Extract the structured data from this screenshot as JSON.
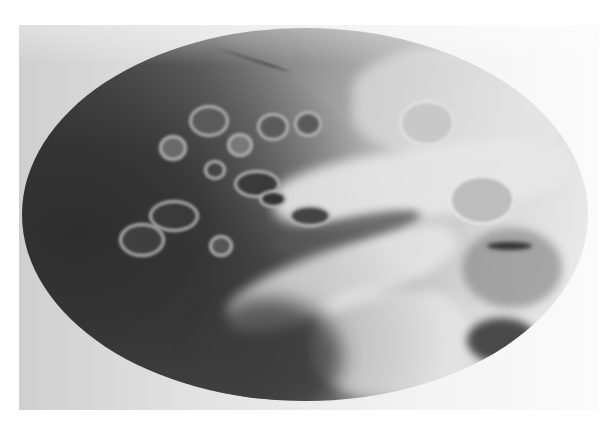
{
  "image": {
    "type": "radiograph",
    "description": "Grayscale oval-field X-ray of temporal bone region showing air cells",
    "palette": {
      "background": "#ffffff",
      "film_light": "#e6e6e6",
      "field_dark": "#2e2e2e",
      "bone_light": "#eeeeee"
    }
  }
}
